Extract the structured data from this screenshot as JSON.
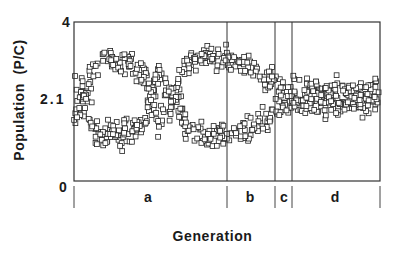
{
  "chart_data": {
    "type": "scatter",
    "title": "",
    "xlabel": "Generation",
    "ylabel": "Population  (P/C)",
    "ylim": [
      0,
      4
    ],
    "yticks": [
      {
        "value": 0,
        "label": "0"
      },
      {
        "value": 2.1,
        "label": "2.1"
      },
      {
        "value": 4,
        "label": "4"
      }
    ],
    "xticks": [],
    "grid": false,
    "legend": null,
    "marker": "open-square",
    "x_domain": [
      0,
      306
    ],
    "regions": [
      {
        "label": "a",
        "start": 0,
        "end": 153
      },
      {
        "label": "b",
        "start": 153,
        "end": 201
      },
      {
        "label": "c",
        "start": 201,
        "end": 218
      },
      {
        "label": "d",
        "start": 218,
        "end": 306
      }
    ],
    "series": [
      {
        "name": "upper band",
        "description": "upper branch of oscillating population (P/C) envelope",
        "x": [
          0,
          6,
          10,
          20,
          35,
          55,
          70,
          76,
          79,
          84,
          90,
          98,
          105,
          112,
          130,
          153,
          175,
          192,
          201,
          210,
          218,
          250,
          306
        ],
        "center": [
          2.55,
          2.2,
          2.1,
          2.9,
          3.05,
          3.0,
          2.65,
          2.15,
          2.2,
          2.75,
          2.4,
          2.15,
          2.4,
          2.95,
          3.05,
          3.05,
          2.85,
          2.6,
          2.45,
          2.2,
          2.1,
          2.1,
          2.1
        ],
        "spread": [
          0.3,
          0.3,
          0.3,
          0.25,
          0.25,
          0.25,
          0.3,
          0.3,
          0.3,
          0.25,
          0.3,
          0.3,
          0.3,
          0.25,
          0.22,
          0.2,
          0.2,
          0.22,
          0.25,
          0.3,
          0.35,
          0.32,
          0.3
        ]
      },
      {
        "name": "lower band",
        "description": "lower branch of oscillating population (P/C) envelope",
        "x": [
          0,
          6,
          10,
          20,
          35,
          55,
          70,
          76,
          79,
          84,
          90,
          98,
          105,
          112,
          130,
          153,
          175,
          192,
          201,
          210,
          218,
          250,
          306
        ],
        "center": [
          1.75,
          2.0,
          2.1,
          1.35,
          1.2,
          1.25,
          1.55,
          2.05,
          2.0,
          1.45,
          1.75,
          2.05,
          1.8,
          1.3,
          1.15,
          1.2,
          1.35,
          1.55,
          1.7,
          1.95,
          2.1,
          2.1,
          2.1
        ],
        "spread": [
          0.3,
          0.3,
          0.3,
          0.25,
          0.25,
          0.25,
          0.3,
          0.3,
          0.3,
          0.25,
          0.3,
          0.3,
          0.3,
          0.25,
          0.22,
          0.2,
          0.2,
          0.22,
          0.25,
          0.3,
          0.35,
          0.32,
          0.3
        ]
      }
    ],
    "points_per_unit_x": 1.2
  },
  "labels": {
    "y_axis_title": "Population  (P/C)",
    "x_axis_title": "Generation",
    "y_tick_top": "4",
    "y_tick_mid": "2.1",
    "y_tick_bottom": "0",
    "region_a": "a",
    "region_b": "b",
    "region_c": "c",
    "region_d": "d"
  }
}
